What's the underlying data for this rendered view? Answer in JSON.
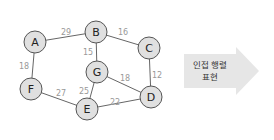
{
  "graph": {
    "nodes": [
      {
        "id": "A",
        "label": "A",
        "x": 35,
        "y": 42
      },
      {
        "id": "B",
        "label": "B",
        "x": 96,
        "y": 32
      },
      {
        "id": "C",
        "label": "C",
        "x": 149,
        "y": 48
      },
      {
        "id": "D",
        "label": "D",
        "x": 151,
        "y": 97
      },
      {
        "id": "E",
        "label": "E",
        "x": 87,
        "y": 109
      },
      {
        "id": "F",
        "label": "F",
        "x": 31,
        "y": 89
      },
      {
        "id": "G",
        "label": "G",
        "x": 97,
        "y": 72
      }
    ],
    "edges": [
      {
        "from": "A",
        "to": "B",
        "weight": "29",
        "lx": 66,
        "ly": 32
      },
      {
        "from": "B",
        "to": "C",
        "weight": "16",
        "lx": 123,
        "ly": 32
      },
      {
        "from": "B",
        "to": "G",
        "weight": "15",
        "lx": 88,
        "ly": 52
      },
      {
        "from": "A",
        "to": "F",
        "weight": "18",
        "lx": 24,
        "ly": 66
      },
      {
        "from": "C",
        "to": "D",
        "weight": "12",
        "lx": 157,
        "ly": 75
      },
      {
        "from": "G",
        "to": "D",
        "weight": "18",
        "lx": 125,
        "ly": 78
      },
      {
        "from": "G",
        "to": "E",
        "weight": "25",
        "lx": 84,
        "ly": 91
      },
      {
        "from": "F",
        "to": "E",
        "weight": "27",
        "lx": 61,
        "ly": 93
      },
      {
        "from": "E",
        "to": "D",
        "weight": "22",
        "lx": 115,
        "ly": 102
      }
    ]
  },
  "arrow": {
    "line1": "인접 행렬",
    "line2": "표현"
  }
}
